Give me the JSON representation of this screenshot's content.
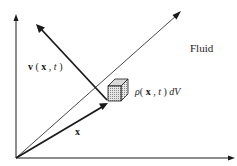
{
  "diagram": {
    "labels": {
      "velocity": "v ( x , t )",
      "velocity_parts": {
        "v": "v",
        "open": " ( ",
        "x": "x",
        "comma": " , ",
        "t": "t",
        "close": " )"
      },
      "position": "x",
      "mass_element": "ρ( x , t ) dV",
      "mass_parts": {
        "rho": "ρ",
        "open": "( ",
        "x": "x",
        "comma": " , ",
        "t": "t",
        "close": " ) ",
        "dV": "dV"
      },
      "region": "Fluid"
    },
    "elements": [
      "vertical-axis",
      "horizontal-axis",
      "diagonal-axis",
      "position-vector-x",
      "velocity-vector-v",
      "volume-element-cube"
    ],
    "colors": {
      "ink": "#1a1a1a",
      "background": "#ffffff",
      "cube_fill": "#bdbdbd"
    }
  }
}
